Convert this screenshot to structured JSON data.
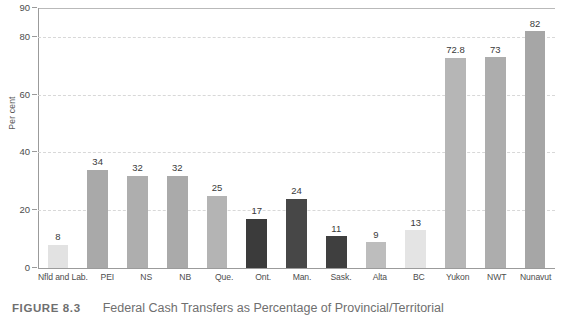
{
  "figure": {
    "number_label": "FIGURE 8.3",
    "caption": "Federal Cash Transfers as Percentage of Provincial/Territorial"
  },
  "chart_data": {
    "type": "bar",
    "title": "",
    "xlabel": "",
    "ylabel": "Per cent",
    "ylim": [
      0,
      90
    ],
    "yticks": [
      0,
      20,
      40,
      60,
      80,
      90
    ],
    "gridlines": [
      20,
      40,
      60,
      80
    ],
    "grid": true,
    "legend": "none",
    "categories": [
      "Nfld and Lab.",
      "PEI",
      "NS",
      "NB",
      "Que.",
      "Ont.",
      "Man.",
      "Sask.",
      "Alta",
      "BC",
      "Yukon",
      "NWT",
      "Nunavut"
    ],
    "values": [
      8,
      34,
      32,
      32,
      25,
      17,
      24,
      11,
      9,
      13,
      72.8,
      73,
      82
    ],
    "value_labels": [
      "8",
      "34",
      "32",
      "32",
      "25",
      "17",
      "24",
      "11",
      "9",
      "13",
      "72.8",
      "73",
      "82"
    ],
    "bar_colors": [
      "#e2e2e2",
      "#a9a9a9",
      "#aeaeae",
      "#aaaaaa",
      "#b4b4b4",
      "#3b3b3b",
      "#474747",
      "#3f3f3f",
      "#bdbdbd",
      "#e4e4e4",
      "#b6b6b6",
      "#adadad",
      "#a6a6a6"
    ]
  },
  "colors": {
    "axis": "#9b9b9b",
    "grid": "#d8d8d8",
    "text": "#4d4d4d",
    "caption": "#6f6f6f",
    "background": "#ffffff"
  }
}
